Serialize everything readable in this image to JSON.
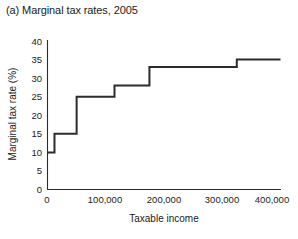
{
  "figure": {
    "title": "(a) Marginal tax rates, 2005",
    "background_color": "#ffffff",
    "line_color": "#2b2b2b",
    "axis_color": "#2b2b2b"
  },
  "chart_data": {
    "type": "line",
    "subtype": "step",
    "title": "(a) Marginal tax rates, 2005",
    "xlabel": "Taxable income",
    "ylabel": "Marginal tax rate (%)",
    "xlim": [
      0,
      400000
    ],
    "ylim": [
      0,
      40
    ],
    "grid": false,
    "legend": null,
    "xticks": [
      0,
      100000,
      200000,
      300000,
      400000
    ],
    "xtick_labels": [
      "0",
      "100,000",
      "200,000",
      "300,000",
      "400,000"
    ],
    "yticks": [
      0,
      5,
      10,
      15,
      20,
      25,
      30,
      35,
      40
    ],
    "ytick_labels": [
      "0",
      "5",
      "10",
      "15",
      "20",
      "25",
      "30",
      "35",
      "40"
    ],
    "series": [
      {
        "name": "Marginal tax rate",
        "bracket_thresholds": [
          0,
          12000,
          50000,
          115000,
          175000,
          325000,
          400000
        ],
        "bracket_rates": [
          10,
          15,
          25,
          28,
          33,
          35
        ],
        "x": [
          0,
          12000,
          12000,
          50000,
          50000,
          115000,
          115000,
          175000,
          175000,
          325000,
          325000,
          400000
        ],
        "y": [
          10,
          10,
          15,
          15,
          25,
          25,
          28,
          28,
          33,
          33,
          35,
          35
        ]
      }
    ]
  }
}
